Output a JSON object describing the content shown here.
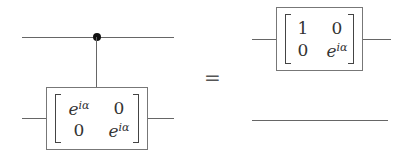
{
  "diagram": {
    "type": "quantum-circuit-identity",
    "left_circuit": {
      "wires": 2,
      "control": {
        "wire": 0,
        "style": "filled-dot"
      },
      "target_gate": {
        "wire": 1,
        "matrix": [
          [
            "e^{iα}",
            "0"
          ],
          [
            "0",
            "e^{iα}"
          ]
        ],
        "cells": {
          "m00_base": "e",
          "m00_exp": "iα",
          "m01": "0",
          "m10": "0",
          "m11_base": "e",
          "m11_exp": "iα"
        }
      }
    },
    "equals": "=",
    "right_circuit": {
      "wires": 2,
      "gate": {
        "wire": 0,
        "matrix": [
          [
            "1",
            "0"
          ],
          [
            "0",
            "e^{iα}"
          ]
        ],
        "cells": {
          "m00": "1",
          "m01": "0",
          "m10": "0",
          "m11_base": "e",
          "m11_exp": "iα"
        }
      },
      "wire1": "identity (empty wire)"
    }
  }
}
